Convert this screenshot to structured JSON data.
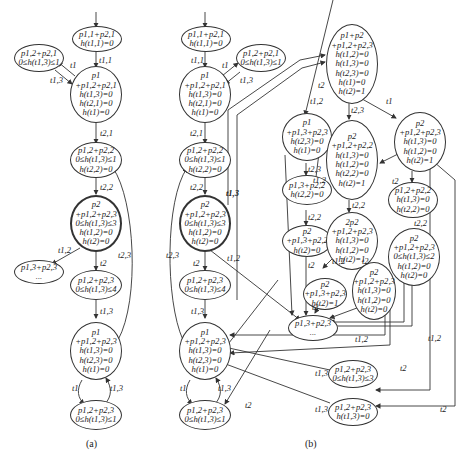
{
  "figure": {
    "page_number": "",
    "caption_a": "(a)",
    "caption_b": "(b)"
  },
  "a": {
    "nodes": [
      {
        "id": "a0",
        "lines": [
          "p1,1+p2,1",
          "h(t1,1)=0"
        ]
      },
      {
        "id": "a1",
        "lines": [
          "p1,2+p2,1",
          "0≤h(t1,3)≤1"
        ]
      },
      {
        "id": "a2",
        "lines": [
          "p1",
          "+p1,2+p2,1",
          "h(t1,3)=0",
          "h(t2,1)=0",
          "h(t1)=0"
        ]
      },
      {
        "id": "a3",
        "lines": [
          "p1,2+p2,2",
          "0≤h(t1,3)≤1",
          "h(t2,2)=0"
        ]
      },
      {
        "id": "a4",
        "lines": [
          "p2",
          "+p1,2+p2,3",
          "0≤h(t1,3)≤3",
          "h(t1,2)=0",
          "h(t2)=0"
        ]
      },
      {
        "id": "a5",
        "lines": [
          "p1,3+p2,3",
          "..."
        ]
      },
      {
        "id": "a6",
        "lines": [
          "p1,2+p2,3",
          "0≤h(t1,3)≤4"
        ]
      },
      {
        "id": "a7",
        "lines": [
          "p1",
          "+p1,2+p2,3",
          "h(t1,3)=0",
          "h(t2,3)=0",
          "h(t1)=0"
        ]
      },
      {
        "id": "a8",
        "lines": [
          "p1,2+p2,3",
          "0≤h(t1,3)≤1"
        ]
      }
    ],
    "edge_labels": [
      "t1,1",
      "t1",
      "t1,3",
      "t2,1",
      "t2,2",
      "t1,2",
      "t2",
      "t2,3",
      "t1,3",
      "t1",
      "t1,3"
    ]
  },
  "b": {
    "nodes": [
      {
        "id": "b0",
        "lines": [
          "p1,1+p2,1",
          "h(t1,1)=0"
        ]
      },
      {
        "id": "b1",
        "lines": [
          "p1,2+p2,1",
          "0≤h(t1,3)≤1"
        ]
      },
      {
        "id": "b2",
        "lines": [
          "p1",
          "+p1,2+p2,1",
          "h(t1,3)=0",
          "h(t2,1)=0",
          "h(t1)=0"
        ]
      },
      {
        "id": "b3",
        "lines": [
          "p1,2+p2,2",
          "0≤h(t1,3)≤1",
          "h(t2,2)=0"
        ]
      },
      {
        "id": "b4",
        "lines": [
          "p2",
          "+p1,2+p2,3",
          "0≤h(t1,3)≤3",
          "h(t1,2)=0",
          "h(t2)=0"
        ]
      },
      {
        "id": "b5",
        "lines": [
          "p1,2+p2,3",
          "0≤h(t1,3)≤4"
        ]
      },
      {
        "id": "b6",
        "lines": [
          "p1",
          "+p1,2+p2,3",
          "h(t1,3)=0",
          "h(t2,3)=0",
          "h(t1)=0"
        ]
      },
      {
        "id": "b7",
        "lines": [
          "p1,2+p2,3",
          "0≤h(t1,3)≤1"
        ]
      },
      {
        "id": "b8",
        "lines": [
          "p1+p2",
          "+p1,2+p2,3",
          "h(t1,2)=0",
          "h(t1,3)=0",
          "h(t2,3)=0",
          "h(t1)=0",
          "h(t2)=1"
        ]
      },
      {
        "id": "b9",
        "lines": [
          "p1",
          "+p1,3+p2,3",
          "h(t2,3)=0",
          "h(t1)=0"
        ]
      },
      {
        "id": "b10",
        "lines": [
          "p2",
          "+p1,2+p2,2",
          "h(t1,3)=0",
          "h(t1,2)=0",
          "h(t2,2)=0",
          "h(t2)=1"
        ]
      },
      {
        "id": "b11",
        "lines": [
          "p2",
          "+p1,2+p2,3",
          "h(t1,3)=0",
          "h(t1,2)=0",
          "h(t2)=1"
        ]
      },
      {
        "id": "b12",
        "lines": [
          "p1,3+p2,2",
          "h(t2,2)=0"
        ]
      },
      {
        "id": "b13",
        "lines": [
          "p2",
          "+p1,3+p2,2",
          "h(t2)=0"
        ]
      },
      {
        "id": "b14",
        "lines": [
          "2p2",
          "+p1,2+p2,3",
          "h(t1,3)=0",
          "h(t1,2)=0",
          "h(t2)=1"
        ]
      },
      {
        "id": "b15",
        "lines": [
          "p1,2+p2,2",
          "h(t1,3)=0",
          "h(t2,2)=0"
        ]
      },
      {
        "id": "b16",
        "lines": [
          "p2",
          "+p1,2+p2,3",
          "0≤h(t1,3)≤2",
          "h(t1,2)=0",
          "h(t2)=0"
        ]
      },
      {
        "id": "b17",
        "lines": [
          "p2",
          "+p1,3+p2,3",
          "h(t2)=1"
        ]
      },
      {
        "id": "b18",
        "lines": [
          "p2",
          "+p1,2+p2,3",
          "h(t1,3)=0",
          "h(t1,2)=0",
          "h(t2)=0"
        ]
      },
      {
        "id": "b19",
        "lines": [
          "p1,3+p2,3",
          "..."
        ]
      },
      {
        "id": "b20",
        "lines": [
          "p1,2+p2,3",
          "0≤h(t1,3)≤3"
        ]
      },
      {
        "id": "b21",
        "lines": [
          "p1,2+p2,3",
          "h(t1,3)=0"
        ]
      }
    ],
    "edge_labels": [
      "t1,1",
      "t1",
      "t1,3",
      "t2,1",
      "t2",
      "t1,2",
      "t2,3",
      "t1",
      "t2,2",
      "t1,3",
      "t2,2",
      "t1,2",
      "t2,3",
      "t2",
      "t1,2",
      "t1,3",
      "t1",
      "t1,3",
      "t2,3",
      "t2,2",
      "t2",
      "t2",
      "t2,2",
      "t1,2",
      "t2",
      "t2",
      "t1,2",
      "t1,2",
      "t2",
      "t2",
      "t1,3",
      "t1,3",
      "t2"
    ]
  }
}
